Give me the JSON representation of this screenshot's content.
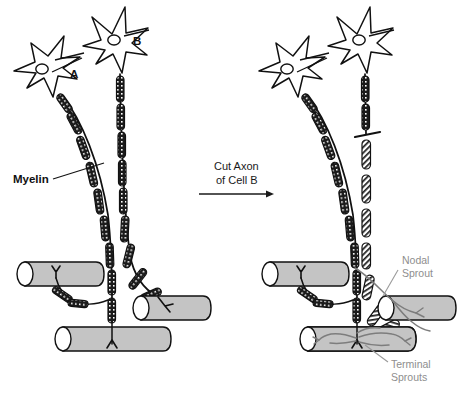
{
  "figure": {
    "background_color": "#ffffff"
  },
  "colors": {
    "ink": "#111111",
    "muscle_fill": "#c4c4c4",
    "sprout_gray": "#7d7d7d",
    "label_gray": "#8e8e8e",
    "paper": "#ffffff"
  },
  "labels": {
    "cell_a": "A",
    "cell_b": "B",
    "myelin": "Myelin",
    "nodal_sprout": "Nodal\nSprout",
    "nodal_sprout_line1": "Nodal",
    "nodal_sprout_line2": "Sprout",
    "terminal_sprouts_line1": "Terminal",
    "terminal_sprouts_line2": "Sprouts"
  },
  "arrow": {
    "line1": "Cut Axon",
    "line2": "of Cell B",
    "direction": "right"
  },
  "panels": [
    {
      "id": "before",
      "side": "left",
      "description": "Intact motor neurons A and B innervating three muscle fibers",
      "neurons": [
        {
          "id": "A",
          "label": "A",
          "state": "intact",
          "myelinated": true
        },
        {
          "id": "B",
          "label": "B",
          "state": "intact",
          "myelinated": true
        }
      ],
      "muscle_fibers": 3,
      "endplates": 3,
      "cut": false
    },
    {
      "id": "after",
      "side": "right",
      "description": "Axon of cell B cut; distal segment degenerates while cell A forms nodal and terminal sprouts",
      "neurons": [
        {
          "id": "A",
          "label": "A",
          "state": "intact",
          "myelinated": true
        },
        {
          "id": "B",
          "label": "B",
          "state": "cut-degenerating",
          "myelinated": true
        }
      ],
      "muscle_fibers": 3,
      "endplates": 3,
      "cut": true,
      "sprouts": [
        "nodal",
        "terminal"
      ]
    }
  ],
  "legend_items": [
    {
      "name": "Myelin",
      "color": "#111111",
      "description": "dark cross-hatched internodal segments"
    },
    {
      "name": "Nodal Sprout",
      "color": "#8e8e8e",
      "description": "gray branch arising at a node of Ranvier"
    },
    {
      "name": "Terminal Sprouts",
      "color": "#8e8e8e",
      "description": "gray branches arising at the nerve terminal"
    }
  ]
}
